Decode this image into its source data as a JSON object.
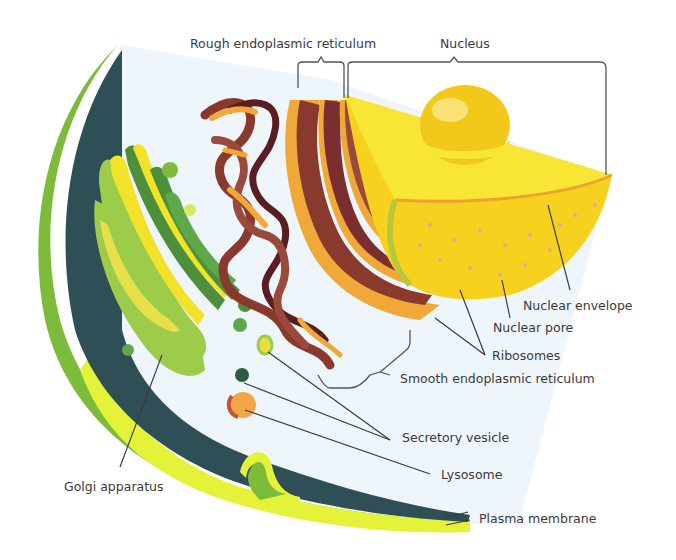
{
  "diagram": {
    "labels": {
      "rough_er": "Rough endoplasmic reticulum",
      "nucleus": "Nucleus",
      "nuclear_envelope": "Nuclear envelope",
      "nuclear_pore": "Nuclear pore",
      "ribosomes": "Ribosomes",
      "smooth_er": "Smooth endoplasmic reticulum",
      "secretory_vesicle": "Secretory vesicle",
      "lysosome": "Lysosome",
      "golgi": "Golgi apparatus",
      "plasma_membrane": "Plasma membrane"
    },
    "colors": {
      "cytoplasm": "#eef6fb",
      "cell_wall_dark": "#2f4f57",
      "membrane_green": "#7cbc3a",
      "membrane_yellow": "#e5f23a",
      "golgi_light": "#9ccc4a",
      "golgi_dark": "#4e8f3c",
      "golgi_yellow": "#f2e22a",
      "er_brown": "#8a3a2c",
      "er_dark": "#5a1e22",
      "er_orange": "#f0a838",
      "nucleus_yellow": "#f6d21e",
      "nucleus_top": "#f8e634",
      "nucleolus": "#f2c81a",
      "lysosome": "#f4a646",
      "lysosome_edge": "#c8503a",
      "vesicle_dark": "#2f5a44",
      "leader_line": "#3a3a3a"
    }
  }
}
